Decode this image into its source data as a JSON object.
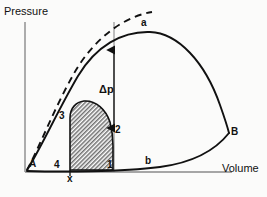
{
  "figure": {
    "type": "pv-diagram",
    "background_color": "#fbfbfa",
    "line_color": "#111111",
    "axis_color": "#8a8a8a",
    "hatch_color": "#6f6f6f"
  },
  "axes": {
    "y_label": "Pressure",
    "x_label": "Volume",
    "origin": {
      "x": 25,
      "y": 172
    },
    "y_axis_top": {
      "x": 25,
      "y": 22
    },
    "x_axis_right": {
      "x": 232,
      "y": 172
    }
  },
  "labels": {
    "peak_point": "a",
    "right_point": "B",
    "lower_curve": "b",
    "origin_point": "A",
    "delta_p": "Δp",
    "corner_top_left": "3",
    "corner_top_right": "2",
    "corner_bottom_left": "4",
    "corner_bottom_right": "1",
    "x_tick": "x"
  },
  "label_positions": {
    "peak_point": {
      "x": 141,
      "y": 18
    },
    "right_point": {
      "x": 231,
      "y": 127
    },
    "lower_curve": {
      "x": 145,
      "y": 156
    },
    "origin_point": {
      "x": 29,
      "y": 159
    },
    "delta_p": {
      "x": 99,
      "y": 84
    },
    "corner_top_left": {
      "x": 59,
      "y": 111
    },
    "corner_top_right": {
      "x": 115,
      "y": 125
    },
    "corner_bottom_left": {
      "x": 54,
      "y": 160
    },
    "corner_bottom_right": {
      "x": 107,
      "y": 160
    },
    "x_tick": {
      "x": 67,
      "y": 174
    },
    "y_label": {
      "x": 4,
      "y": 6
    },
    "x_label": {
      "x": 222,
      "y": 163
    }
  },
  "curves": {
    "solid_upper": {
      "name": "solid-pv-curve",
      "description": "solid curve from A through peak a down to B and along b",
      "path": "M 27 170 C 40 150 58 110 78 76 C 96 46 122 31 150 32 C 178 33 205 62 220 105 C 226 122 228 129 229 133"
    },
    "lower_branch": {
      "name": "lower-branch-curve",
      "description": "curve from B down-left to near origin through label b",
      "path": "M 229 133 C 214 152 190 163 160 167 C 120 172 60 172 27 171"
    },
    "dashed_upper": {
      "name": "dashed-pv-curve",
      "description": "dashed curve above solid curve",
      "path": "M 27 170 C 40 146 56 104 76 70 C 94 40 122 17 152 12"
    }
  },
  "shaded_region": {
    "name": "hatched-work-region",
    "description": "cross-hatched area with corners 4,3,2,1",
    "path": "M 70 170 L 70 118 C 70 108 76 102 84 101 C 96 100 106 110 110 122 C 112 130 113 140 113 146 L 113 170 Z"
  },
  "arrow": {
    "name": "delta-p-arrow",
    "description": "double-headed vertical measure of pressure drop",
    "x": 114,
    "y_top": 50,
    "y_bottom": 96,
    "down_x": 114,
    "down_y_top": 96,
    "down_y_bottom": 128
  }
}
